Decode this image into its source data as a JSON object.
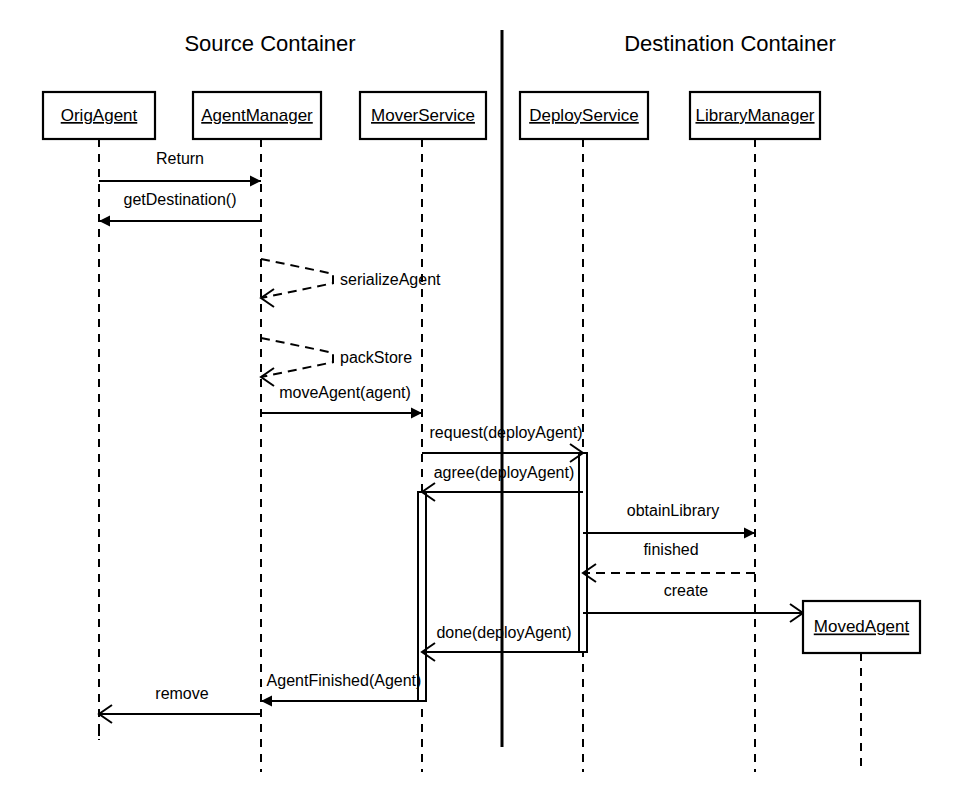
{
  "diagram": {
    "type": "uml-sequence-diagram",
    "width": 957,
    "height": 808,
    "background_color": "#ffffff",
    "line_color": "#000000"
  },
  "groups": [
    {
      "id": "source",
      "title": "Source Container",
      "x": 270,
      "y": 45
    },
    {
      "id": "destination",
      "title": "Destination Container",
      "x": 730,
      "y": 45
    }
  ],
  "divider": {
    "x": 502,
    "y_top": 30,
    "y_bottom": 747
  },
  "participants": [
    {
      "id": "origagent",
      "label": "OrigAgent",
      "box": {
        "x": 43,
        "y": 92,
        "w": 112,
        "h": 47
      },
      "lifeline_x": 99,
      "lifeline_top": 139,
      "lifeline_bottom": 740,
      "destroyed": true
    },
    {
      "id": "agentmanager",
      "label": "AgentManager",
      "box": {
        "x": 193,
        "y": 92,
        "w": 128,
        "h": 47
      },
      "lifeline_x": 261,
      "lifeline_top": 139,
      "lifeline_bottom": 772,
      "destroyed": false
    },
    {
      "id": "moverservice",
      "label": "MoverService",
      "box": {
        "x": 360,
        "y": 92,
        "w": 126,
        "h": 47
      },
      "lifeline_x": 422,
      "lifeline_top": 139,
      "lifeline_bottom": 772,
      "destroyed": false
    },
    {
      "id": "deployservice",
      "label": "DeployService",
      "box": {
        "x": 520,
        "y": 92,
        "w": 128,
        "h": 47
      },
      "lifeline_x": 583,
      "lifeline_top": 139,
      "lifeline_bottom": 772,
      "destroyed": false
    },
    {
      "id": "librarymanager",
      "label": "LibraryManager",
      "box": {
        "x": 690,
        "y": 92,
        "w": 130,
        "h": 47
      },
      "lifeline_x": 755,
      "lifeline_top": 139,
      "lifeline_bottom": 772,
      "destroyed": false
    },
    {
      "id": "movedagent",
      "label": "MovedAgent",
      "box": {
        "x": 803,
        "y": 601,
        "w": 117,
        "h": 52
      },
      "lifeline_x": 861,
      "lifeline_top": 653,
      "lifeline_bottom": 772,
      "destroyed": false
    }
  ],
  "messages": [
    {
      "id": "m1",
      "label": "Return",
      "from": "origagent",
      "to": "agentmanager",
      "x1": 99,
      "x2": 261,
      "y": 181,
      "style": "solid",
      "arrow": "filled",
      "direction": "right",
      "label_x": 180,
      "label_y": 160,
      "label_anchor": "mid"
    },
    {
      "id": "m2",
      "label": "getDestination()",
      "from": "agentmanager",
      "to": "origagent",
      "x1": 261,
      "x2": 99,
      "y": 221,
      "style": "solid",
      "arrow": "filled",
      "direction": "left",
      "label_x": 180,
      "label_y": 201,
      "label_anchor": "mid"
    },
    {
      "id": "m3",
      "label": "serializeAgent",
      "from": "agentmanager",
      "to": "agentmanager",
      "self": true,
      "x": 261,
      "y_top": 259,
      "y_bottom": 298,
      "loop_w": 72,
      "style": "dashed",
      "arrow": "open",
      "direction": "left",
      "label_x": 340,
      "label_y": 281,
      "label_anchor": "start"
    },
    {
      "id": "m4",
      "label": "packStore",
      "from": "agentmanager",
      "to": "agentmanager",
      "self": true,
      "x": 261,
      "y_top": 338,
      "y_bottom": 377,
      "loop_w": 72,
      "style": "dashed",
      "arrow": "open",
      "direction": "left",
      "label_x": 340,
      "label_y": 359,
      "label_anchor": "start"
    },
    {
      "id": "m5",
      "label": "moveAgent(agent)",
      "from": "agentmanager",
      "to": "moverservice",
      "x1": 261,
      "x2": 422,
      "y": 413,
      "style": "solid",
      "arrow": "filled",
      "direction": "right",
      "label_x": 345,
      "label_y": 394,
      "label_anchor": "mid"
    },
    {
      "id": "m6",
      "label": "request(deployAgent)",
      "from": "moverservice",
      "to": "deployservice",
      "x1": 422,
      "x2": 583,
      "y": 453,
      "style": "solid",
      "arrow": "open",
      "direction": "right",
      "label_x": 506,
      "label_y": 434,
      "label_anchor": "mid"
    },
    {
      "id": "m7",
      "label": "agree(deployAgent)",
      "from": "deployservice",
      "to": "moverservice",
      "x1": 583,
      "x2": 422,
      "y": 492,
      "style": "solid",
      "arrow": "open",
      "direction": "left",
      "label_x": 504,
      "label_y": 474,
      "label_anchor": "mid"
    },
    {
      "id": "m8",
      "label": "obtainLibrary",
      "from": "deployservice",
      "to": "librarymanager",
      "x1": 583,
      "x2": 755,
      "y": 533,
      "style": "solid",
      "arrow": "filled",
      "direction": "right",
      "label_x": 673,
      "label_y": 512,
      "label_anchor": "mid"
    },
    {
      "id": "m9",
      "label": "finished",
      "from": "librarymanager",
      "to": "deployservice",
      "x1": 755,
      "x2": 583,
      "y": 573,
      "style": "dashed",
      "arrow": "open",
      "direction": "left",
      "label_x": 671,
      "label_y": 551,
      "label_anchor": "mid"
    },
    {
      "id": "m10",
      "label": "create",
      "from": "deployservice",
      "to": "movedagent",
      "x1": 583,
      "x2": 803,
      "y": 613,
      "style": "solid",
      "arrow": "open",
      "direction": "right",
      "label_x": 686,
      "label_y": 592,
      "label_anchor": "mid"
    },
    {
      "id": "m11",
      "label": "done(deployAgent)",
      "from": "deployservice",
      "to": "moverservice",
      "x1": 583,
      "x2": 422,
      "y": 652,
      "style": "solid",
      "arrow": "open",
      "direction": "left",
      "label_x": 504,
      "label_y": 634,
      "label_anchor": "mid"
    },
    {
      "id": "m12",
      "label": "AgentFinished(Agent)",
      "from": "moverservice",
      "to": "agentmanager",
      "x1": 422,
      "x2": 261,
      "y": 701,
      "style": "solid",
      "arrow": "filled",
      "direction": "left",
      "label_x": 344,
      "label_y": 682,
      "label_anchor": "mid"
    },
    {
      "id": "m13",
      "label": "remove",
      "from": "agentmanager",
      "to": "origagent",
      "x1": 261,
      "x2": 99,
      "y": 714,
      "style": "solid",
      "arrow": "open",
      "direction": "left",
      "label_x": 182,
      "label_y": 695,
      "label_anchor": "mid"
    }
  ],
  "activations": [
    {
      "id": "a-deploy",
      "participant": "deployservice",
      "x": 583,
      "y": 453,
      "w": 8,
      "h": 199
    },
    {
      "id": "a-mover",
      "participant": "moverservice",
      "x": 422,
      "y": 492,
      "w": 8,
      "h": 209
    }
  ]
}
